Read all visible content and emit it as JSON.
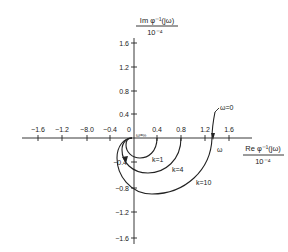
{
  "figure": {
    "type": "nyquist-inverse-plot",
    "y_axis_title_num": "Im φ⁻¹(jω)",
    "y_axis_title_den": "10⁻⁴",
    "x_axis_title_num": "Re φ⁻¹(jω)",
    "x_axis_title_den": "10⁻⁴",
    "x_ticks_neg": [
      "−1.6",
      "−1.2",
      "−8.0",
      "−0.4"
    ],
    "x_ticks_pos": [
      "0.4",
      "0.8",
      "1.2",
      "1.6"
    ],
    "origin_label": "0",
    "y_ticks_pos": [
      "1.6",
      "1.2",
      "0.8",
      "0.4"
    ],
    "y_ticks_neg": [
      "−0.4",
      "−0.8",
      "−1.2",
      "−1.6"
    ],
    "omega_inf_label": "ω=∞",
    "omega_zero_label": "ω=0",
    "omega_dir_label": "ω",
    "curves": [
      {
        "label": "k=1",
        "re_start": 0.4
      },
      {
        "label": "k=4",
        "re_start": 0.8
      },
      {
        "label": "k=10",
        "re_start": 1.3
      }
    ]
  }
}
